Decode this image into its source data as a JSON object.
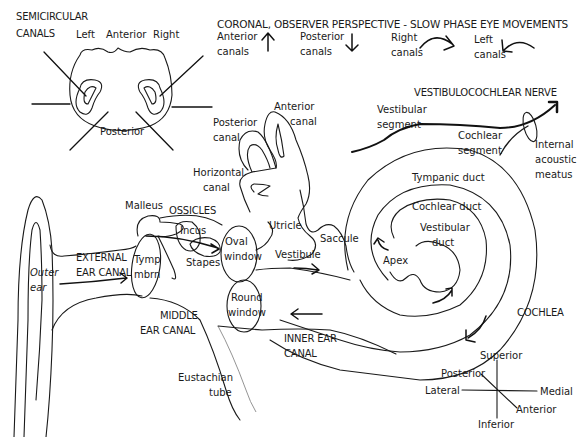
{
  "diagram": {
    "semicircular_panel": {
      "heading_line1": "SEMICIRCULAR",
      "heading_line2": "CANALS",
      "left": "Left",
      "anterior": "Anterior",
      "right": "Right",
      "posterior": "Posterior"
    },
    "slow_phase_panel": {
      "heading": "CORONAL, OBSERVER PERSPECTIVE - SLOW PHASE EYE MOVEMENTS",
      "items": [
        {
          "line1": "Anterior",
          "line2": "canals",
          "arrow": "up-arrow"
        },
        {
          "line1": "Posterior",
          "line2": "canals",
          "arrow": "down-arrow"
        },
        {
          "line1": "Right",
          "line2": "canals",
          "arrow": "curved-right-arrow"
        },
        {
          "line1": "Left",
          "line2": "canals",
          "arrow": "curved-left-arrow"
        }
      ]
    },
    "nerve": {
      "heading": "VESTIBULOCOCHLEAR NERVE",
      "vestibular_line1": "Vestibular",
      "vestibular_line2": "segment",
      "cochlear_line1": "Cochlear",
      "cochlear_line2": "segment",
      "meatus_line1": "Internal",
      "meatus_line2": "acoustic",
      "meatus_line3": "meatus"
    },
    "inner_ear": {
      "anterior_canal_line1": "Anterior",
      "anterior_canal_line2": "canal",
      "posterior_canal_line1": "Posterior",
      "posterior_canal_line2": "canal",
      "horizontal_canal_line1": "Horizontal",
      "horizontal_canal_line2": "canal",
      "utricle": "Utricle",
      "saccule": "Saccule",
      "vestibule": "Vestibule"
    },
    "cochlea": {
      "label": "COCHLEA",
      "tympanic_duct": "Tympanic duct",
      "cochlear_duct": "Cochlear duct",
      "vestibular_duct_line1": "Vestibular",
      "vestibular_duct_line2": "duct",
      "apex": "Apex"
    },
    "middle_ear": {
      "malleus": "Malleus",
      "ossicles": "OSSICLES",
      "incus": "Incus",
      "stapes": "Stapes",
      "oval_window_line1": "Oval",
      "oval_window_line2": "window",
      "round_window_line1": "Round",
      "round_window_line2": "window",
      "tymp_line1": "Tymp",
      "tymp_line2": "mbrn",
      "middle_ear_canal_line1": "MIDDLE",
      "middle_ear_canal_line2": "EAR CANAL",
      "eustachian_line1": "Eustachian",
      "eustachian_line2": "tube"
    },
    "outer_ear": {
      "outer_ear_line1": "Outer",
      "outer_ear_line2": "ear",
      "external_canal_line1": "EXTERNAL",
      "external_canal_line2": "EAR CANAL"
    },
    "inner_ear_canal": {
      "line1": "INNER EAR",
      "line2": "CANAL"
    },
    "compass": {
      "superior": "Superior",
      "inferior": "Inferior",
      "lateral": "Lateral",
      "medial": "Medial",
      "posterior": "Posterior",
      "anterior": "Anterior"
    },
    "colors": {
      "ink": "#1a1a1a",
      "background": "#ffffff"
    }
  }
}
